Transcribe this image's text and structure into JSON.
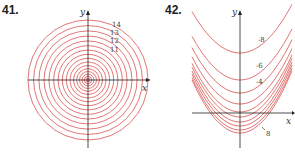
{
  "chart_data": [
    {
      "type": "line",
      "title": "41.",
      "description": "Contour map: concentric circles centered at origin, denser toward center",
      "xlabel": "x",
      "ylabel": "y",
      "level_labels": [
        "14",
        "13",
        "12",
        "11"
      ],
      "num_contours": 17,
      "color": "#d9534f"
    },
    {
      "type": "line",
      "title": "42.",
      "description": "Contour map: nested upward-opening parabolas, denser toward bottom",
      "xlabel": "x",
      "ylabel": "y",
      "level_labels": [
        "-8",
        "-6",
        "-4",
        "8"
      ],
      "num_contours": 10,
      "color": "#d9534f"
    }
  ],
  "labels": {
    "fig1": "41.",
    "fig2": "42."
  }
}
